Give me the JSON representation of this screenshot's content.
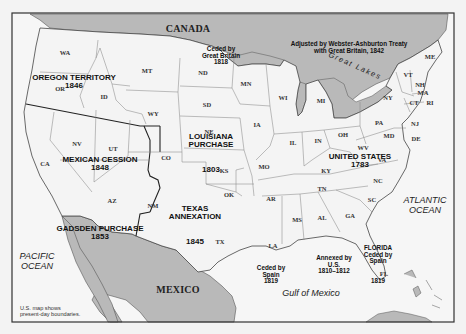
{
  "map": {
    "title": "U.S. territorial expansion",
    "colors": {
      "land_us": "#f4f4f4",
      "land_foreign": "#b9b9b9",
      "water": "#f6f6f6",
      "lakes": "#b9b9b9",
      "frame": "#333333",
      "state_border": "#888888",
      "territory_border": "#222222",
      "page_bg": "#f3f3f3"
    },
    "countries": {
      "canada": "CANADA",
      "mexico": "MEXICO"
    },
    "water_bodies": {
      "pacific": "PACIFIC\nOCEAN",
      "atlantic": "ATLANTIC\nOCEAN",
      "gulf": "Gulf of Mexico",
      "great_lakes": "Great Lakes"
    },
    "acquisitions": [
      {
        "id": "oregon",
        "name": "OREGON TERRITORY",
        "year": "1846"
      },
      {
        "id": "mexican-cession",
        "name": "MEXICAN CESSION",
        "year": "1848"
      },
      {
        "id": "louisiana",
        "name": "LOUISIANA\nPURCHASE",
        "year": "1803"
      },
      {
        "id": "united-states",
        "name": "UNITED STATES",
        "year": "1783"
      },
      {
        "id": "texas",
        "name": "TEXAS\nANNEXATION",
        "year": "1845"
      },
      {
        "id": "gadsden",
        "name": "GADSDEN PURCHASE",
        "year": "1853"
      },
      {
        "id": "florida",
        "name": "FLORIDA\nCeded by\nSpain",
        "year": "1819"
      }
    ],
    "annotations": {
      "great_britain_1818": "Ceded by\nGreat Britain\n1818",
      "webster_ashburton": "Adjusted by Webster-Ashburton Treaty\nwith Great Britain, 1842",
      "spain_1819_west": "Ceded by\nSpain\n1819",
      "annexed_us": "Annexed by\nU.S.\n1810–1812",
      "footnote": "U.S. map shows\npresent-day boundaries."
    },
    "states": [
      {
        "abbr": "WA"
      },
      {
        "abbr": "OR"
      },
      {
        "abbr": "ID"
      },
      {
        "abbr": "MT"
      },
      {
        "abbr": "WY"
      },
      {
        "abbr": "CA"
      },
      {
        "abbr": "NV"
      },
      {
        "abbr": "UT"
      },
      {
        "abbr": "AZ"
      },
      {
        "abbr": "CO"
      },
      {
        "abbr": "NM"
      },
      {
        "abbr": "ND"
      },
      {
        "abbr": "SD"
      },
      {
        "abbr": "NE"
      },
      {
        "abbr": "KS"
      },
      {
        "abbr": "OK"
      },
      {
        "abbr": "TX"
      },
      {
        "abbr": "MN"
      },
      {
        "abbr": "IA"
      },
      {
        "abbr": "MO"
      },
      {
        "abbr": "AR"
      },
      {
        "abbr": "LA"
      },
      {
        "abbr": "WI"
      },
      {
        "abbr": "IL"
      },
      {
        "abbr": "MI"
      },
      {
        "abbr": "IN"
      },
      {
        "abbr": "OH"
      },
      {
        "abbr": "KY"
      },
      {
        "abbr": "TN"
      },
      {
        "abbr": "MS"
      },
      {
        "abbr": "AL"
      },
      {
        "abbr": "GA"
      },
      {
        "abbr": "FL"
      },
      {
        "abbr": "SC"
      },
      {
        "abbr": "NC"
      },
      {
        "abbr": "VA"
      },
      {
        "abbr": "WV"
      },
      {
        "abbr": "PA"
      },
      {
        "abbr": "NY"
      },
      {
        "abbr": "VT"
      },
      {
        "abbr": "NH"
      },
      {
        "abbr": "ME"
      },
      {
        "abbr": "MA"
      },
      {
        "abbr": "CT"
      },
      {
        "abbr": "RI"
      },
      {
        "abbr": "NJ"
      },
      {
        "abbr": "DE"
      },
      {
        "abbr": "MD"
      }
    ]
  }
}
